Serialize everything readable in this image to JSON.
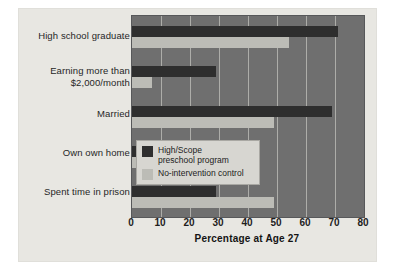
{
  "chart_data": {
    "type": "bar",
    "orientation": "horizontal",
    "title": "",
    "xlabel": "Percentage at Age 27",
    "ylabel": "",
    "xlim": [
      0,
      80
    ],
    "xticks": [
      0,
      10,
      20,
      30,
      40,
      50,
      60,
      70,
      80
    ],
    "grid": true,
    "legend_position": "inside-right-middle",
    "categories": [
      "High school graduate",
      "Earning more than\n$2,000/month",
      "Married",
      "Own own home",
      "Spent time in prison"
    ],
    "series": [
      {
        "name": "High/Scope\npreschool program",
        "color": "#2e2e2e",
        "values": [
          71,
          29,
          69,
          36,
          29
        ]
      },
      {
        "name": "No-intervention control",
        "color": "#bcbcb6",
        "values": [
          54,
          7,
          49,
          13,
          49
        ]
      }
    ]
  },
  "axis": {
    "x_title": "Percentage at Age 27",
    "tick_labels": [
      "0",
      "10",
      "20",
      "30",
      "40",
      "50",
      "60",
      "70",
      "80"
    ]
  },
  "legend": {
    "items": [
      {
        "label": "High/Scope\npreschool program",
        "color": "#2e2e2e"
      },
      {
        "label": "No-intervention control",
        "color": "#bcbcb6"
      }
    ]
  },
  "colors": {
    "page_background": "#ffffff",
    "card_background": "#e8e7e2",
    "plot_background": "#6f6f6f",
    "gridline": "#b9b9b4",
    "series_dark": "#2e2e2e",
    "series_light": "#bcbcb6",
    "legend_background": "#d7d6d1",
    "text": "#1e1e1e"
  }
}
